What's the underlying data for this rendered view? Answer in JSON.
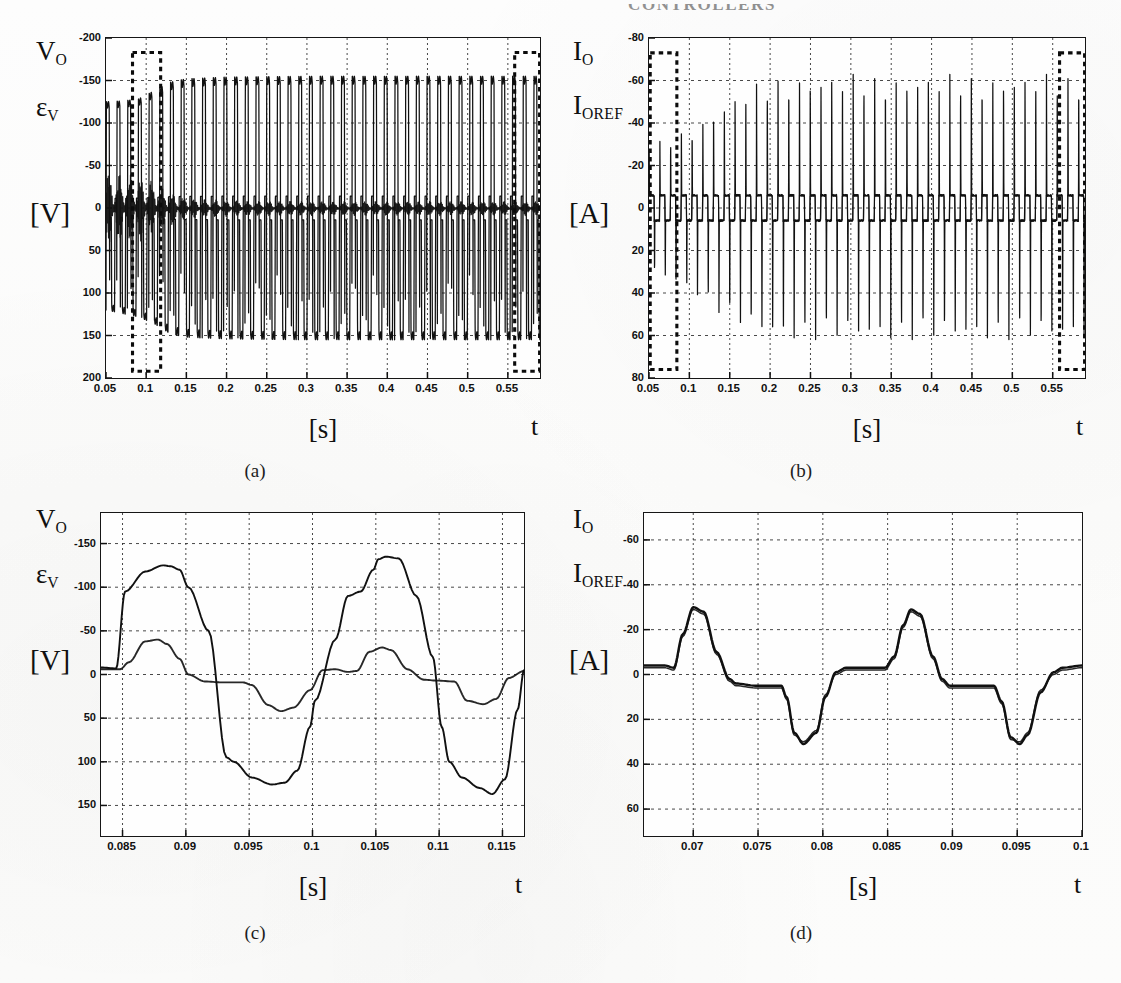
{
  "header": {
    "running_title": "CONTROLLERS"
  },
  "panels": [
    {
      "id": "a",
      "caption": "(a)",
      "signal_labels": [
        {
          "base": "V",
          "sub": "O"
        },
        {
          "base": "ε",
          "sub": "V"
        }
      ],
      "unit_label": "[V]",
      "x_unit": "[s]",
      "x_axis_symbol": "t",
      "yticks": [
        "200",
        "150",
        "100",
        "50",
        "0",
        "-50",
        "-100",
        "-150",
        "-200"
      ],
      "xticks": [
        "0.05",
        "0.1",
        "0.15",
        "0.2",
        "0.25",
        "0.3",
        "0.35",
        "0.4",
        "0.45",
        "0.5",
        "0.55"
      ]
    },
    {
      "id": "b",
      "caption": "(b)",
      "signal_labels": [
        {
          "base": "I",
          "sub": "O"
        },
        {
          "base": "I",
          "sub": "OREF"
        }
      ],
      "unit_label": "[A]",
      "x_unit": "[s]",
      "x_axis_symbol": "t",
      "yticks": [
        "80",
        "60",
        "40",
        "20",
        "0",
        "-20",
        "-40",
        "-60",
        "-80"
      ],
      "xticks": [
        "0.05",
        "0.1",
        "0.15",
        "0.2",
        "0.25",
        "0.3",
        "0.35",
        "0.4",
        "0.45",
        "0.5",
        "0.55"
      ]
    },
    {
      "id": "c",
      "caption": "(c)",
      "signal_labels": [
        {
          "base": "V",
          "sub": "O"
        },
        {
          "base": "ε",
          "sub": "V"
        }
      ],
      "unit_label": "[V]",
      "x_unit": "[s]",
      "x_axis_symbol": "t",
      "yticks": [
        "150",
        "100",
        "50",
        "0",
        "-50",
        "-100",
        "-150"
      ],
      "xticks": [
        "0.085",
        "0.09",
        "0.095",
        "0.1",
        "0.105",
        "0.11",
        "0.115"
      ]
    },
    {
      "id": "d",
      "caption": "(d)",
      "signal_labels": [
        {
          "base": "I",
          "sub": "O"
        },
        {
          "base": "I",
          "sub": "OREF"
        }
      ],
      "unit_label": "[A]",
      "x_unit": "[s]",
      "x_axis_symbol": "t",
      "yticks": [
        "60",
        "40",
        "20",
        "0",
        "-20",
        "-40",
        "-60"
      ],
      "xticks": [
        "0.07",
        "0.075",
        "0.08",
        "0.085",
        "0.09",
        "0.095",
        "0.1"
      ]
    }
  ],
  "chart_data": [
    {
      "type": "line",
      "panel": "a",
      "title": "Output voltage and voltage error vs time",
      "xlabel": "[s]",
      "ylabel": "[V]",
      "xlim": [
        0.05,
        0.59
      ],
      "ylim": [
        -200,
        200
      ],
      "xticks": [
        0.05,
        0.1,
        0.15,
        0.2,
        0.25,
        0.3,
        0.35,
        0.4,
        0.45,
        0.5,
        0.55
      ],
      "yticks": [
        -200,
        -150,
        -100,
        -50,
        0,
        50,
        100,
        150,
        200
      ],
      "grid": true,
      "legend": "none",
      "series": [
        {
          "name": "V_O",
          "description": "Square-wave-like output voltage, ~50 Hz period 0.02 s, amplitude ramps from about 125 V at t=0.05 s up to a steady 155 V after t=0.15 s",
          "envelope_x": [
            0.05,
            0.07,
            0.09,
            0.11,
            0.13,
            0.15,
            0.2,
            0.3,
            0.4,
            0.5,
            0.59
          ],
          "envelope_peak": [
            125,
            126,
            128,
            138,
            148,
            152,
            154,
            155,
            155,
            155,
            155
          ],
          "envelope_trough": [
            -120,
            -124,
            -128,
            -136,
            -148,
            -152,
            -154,
            -155,
            -155,
            -155,
            -155
          ],
          "period": 0.0133
        },
        {
          "name": "epsilon_V",
          "description": "Voltage tracking error, large ripple band at startup (about +/-45 V) decaying to a thin band near 0 V after t=0.15 s",
          "envelope_x": [
            0.05,
            0.07,
            0.09,
            0.11,
            0.13,
            0.15,
            0.2,
            0.3,
            0.45,
            0.59
          ],
          "envelope_peak": [
            45,
            42,
            40,
            32,
            20,
            12,
            9,
            8,
            8,
            8
          ],
          "envelope_trough": [
            -45,
            -42,
            -40,
            -32,
            -22,
            -13,
            -10,
            -9,
            -9,
            -9
          ]
        }
      ],
      "annotations": [
        {
          "type": "dashed-rect",
          "label": "detail-window-start",
          "x0": 0.083,
          "x1": 0.118,
          "y0": -192,
          "y1": 183
        },
        {
          "type": "dashed-rect",
          "label": "detail-window-end",
          "x0": 0.5585,
          "x1": 0.5895,
          "y0": -192,
          "y1": 183
        }
      ]
    },
    {
      "type": "line",
      "panel": "b",
      "title": "Output current and reference current vs time",
      "xlabel": "[s]",
      "ylabel": "[A]",
      "xlim": [
        0.05,
        0.59
      ],
      "ylim": [
        -80,
        80
      ],
      "xticks": [
        0.05,
        0.1,
        0.15,
        0.2,
        0.25,
        0.3,
        0.35,
        0.4,
        0.45,
        0.5,
        0.55
      ],
      "yticks": [
        -80,
        -60,
        -40,
        -20,
        0,
        20,
        40,
        60,
        80
      ],
      "grid": true,
      "legend": "none",
      "series": [
        {
          "name": "I_O",
          "description": "Sharp bipolar current spikes on a small plateau; spike amplitude grows from about 30 A at t=0.05 s to a steady 63 A after t=0.22 s",
          "envelope_x": [
            0.05,
            0.07,
            0.09,
            0.11,
            0.13,
            0.15,
            0.18,
            0.22,
            0.3,
            0.45,
            0.59
          ],
          "envelope_peak": [
            30,
            32,
            36,
            40,
            46,
            52,
            58,
            63,
            63,
            63,
            63
          ],
          "envelope_trough": [
            -32,
            -34,
            -38,
            -42,
            -48,
            -54,
            -60,
            -63,
            -63,
            -63,
            -63
          ],
          "plateau_high": 6,
          "plateau_low": -6,
          "period": 0.0133
        },
        {
          "name": "I_OREF",
          "description": "Reference current essentially overlapping I_O"
        }
      ],
      "annotations": [
        {
          "type": "dashed-rect",
          "label": "detail-window-start",
          "x0": 0.0515,
          "x1": 0.0845,
          "y0": -76,
          "y1": 73
        },
        {
          "type": "dashed-rect",
          "label": "detail-window-end",
          "x0": 0.5585,
          "x1": 0.5895,
          "y0": -76,
          "y1": 73
        }
      ]
    },
    {
      "type": "line",
      "panel": "c",
      "title": "Zoom of output voltage and voltage error",
      "xlabel": "[s]",
      "ylabel": "[V]",
      "xlim": [
        0.0833,
        0.1167
      ],
      "ylim": [
        -185,
        185
      ],
      "xticks": [
        0.085,
        0.09,
        0.095,
        0.1,
        0.105,
        0.11,
        0.115
      ],
      "yticks": [
        -150,
        -100,
        -50,
        0,
        50,
        100,
        150
      ],
      "grid": true,
      "legend": "none",
      "series": [
        {
          "name": "V_O",
          "x": [
            0.0833,
            0.0845,
            0.0852,
            0.0868,
            0.0882,
            0.0888,
            0.0895,
            0.0902,
            0.0918,
            0.0932,
            0.0938,
            0.0952,
            0.0968,
            0.0978,
            0.0988,
            0.0998,
            0.1002,
            0.1018,
            0.1028,
            0.1038,
            0.1048,
            0.1052,
            0.1058,
            0.1068,
            0.1082,
            0.1095,
            0.1102,
            0.1108,
            0.1118,
            0.1132,
            0.1142,
            0.1152,
            0.1162,
            0.1167
          ],
          "y": [
            8,
            7,
            95,
            118,
            125,
            124,
            120,
            100,
            50,
            -95,
            -100,
            -118,
            -126,
            -124,
            -110,
            -60,
            -30,
            40,
            90,
            95,
            120,
            132,
            135,
            133,
            90,
            20,
            -60,
            -100,
            -118,
            -130,
            -137,
            -120,
            -40,
            5
          ]
        },
        {
          "name": "epsilon_V",
          "x": [
            0.0833,
            0.0848,
            0.0855,
            0.0868,
            0.0878,
            0.0885,
            0.0895,
            0.0902,
            0.0915,
            0.0928,
            0.0945,
            0.0952,
            0.0965,
            0.0975,
            0.0985,
            0.0998,
            0.1008,
            0.1018,
            0.1028,
            0.1035,
            0.1045,
            0.1055,
            0.1062,
            0.1075,
            0.1088,
            0.1098,
            0.1112,
            0.1122,
            0.1135,
            0.1145,
            0.1155,
            0.1167
          ],
          "y": [
            6,
            6,
            14,
            38,
            40,
            35,
            18,
            0,
            -8,
            -9,
            -9,
            -12,
            -35,
            -42,
            -38,
            -18,
            5,
            6,
            3,
            4,
            26,
            31,
            28,
            6,
            -6,
            -7,
            -8,
            -30,
            -34,
            -28,
            -4,
            4
          ]
        }
      ]
    },
    {
      "type": "line",
      "panel": "d",
      "title": "Zoom of output current and reference current",
      "xlabel": "[s]",
      "ylabel": "[A]",
      "xlim": [
        0.0662,
        0.1
      ],
      "ylim": [
        -72,
        72
      ],
      "xticks": [
        0.07,
        0.075,
        0.08,
        0.085,
        0.09,
        0.095,
        0.1
      ],
      "yticks": [
        -60,
        -40,
        -20,
        0,
        20,
        40,
        60
      ],
      "grid": true,
      "legend": "none",
      "series": [
        {
          "name": "I_O",
          "x": [
            0.0662,
            0.0678,
            0.0685,
            0.0692,
            0.07,
            0.0708,
            0.0718,
            0.0728,
            0.0733,
            0.0748,
            0.0768,
            0.0772,
            0.0778,
            0.0785,
            0.0795,
            0.0802,
            0.081,
            0.0818,
            0.0838,
            0.0848,
            0.0855,
            0.0862,
            0.0868,
            0.0875,
            0.0885,
            0.0892,
            0.0898,
            0.0912,
            0.0932,
            0.0938,
            0.0945,
            0.0952,
            0.0958,
            0.0968,
            0.0978,
            0.0985,
            0.1
          ],
          "y": [
            4,
            4,
            3,
            18,
            30,
            28,
            10,
            -2,
            -4,
            -5,
            -5,
            -10,
            -26,
            -31,
            -26,
            -10,
            1,
            3,
            3,
            3,
            8,
            22,
            29,
            27,
            8,
            -2,
            -5,
            -5,
            -5,
            -12,
            -28,
            -31,
            -27,
            -8,
            1,
            3,
            4
          ]
        },
        {
          "name": "I_OREF",
          "description": "Reference current overlapping I_O with a small offset, drawn as a second nearly-coincident trace",
          "x": [
            0.0662,
            0.0678,
            0.0685,
            0.0692,
            0.07,
            0.0708,
            0.0718,
            0.0728,
            0.0733,
            0.0748,
            0.0768,
            0.0772,
            0.0778,
            0.0785,
            0.0795,
            0.0802,
            0.081,
            0.0818,
            0.0838,
            0.0848,
            0.0855,
            0.0862,
            0.0868,
            0.0875,
            0.0885,
            0.0892,
            0.0898,
            0.0912,
            0.0932,
            0.0938,
            0.0945,
            0.0952,
            0.0958,
            0.0968,
            0.0978,
            0.0985,
            0.1
          ],
          "y": [
            3,
            3,
            2,
            17,
            29,
            27,
            9,
            -3,
            -5,
            -6,
            -6,
            -11,
            -27,
            -30,
            -25,
            -9,
            0,
            2,
            2,
            2,
            7,
            21,
            28,
            26,
            7,
            -3,
            -6,
            -6,
            -6,
            -13,
            -29,
            -30,
            -26,
            -7,
            0,
            2,
            3
          ]
        }
      ]
    }
  ]
}
